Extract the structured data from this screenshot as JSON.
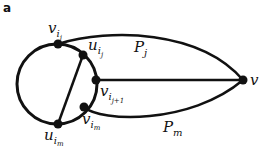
{
  "panel_label": "a",
  "nodes": {
    "v_ij": {
      "base": "v",
      "sub": "i",
      "subsub": "j"
    },
    "u_ij": {
      "base": "u",
      "sub": "i",
      "subsub": "j"
    },
    "v_ij1": {
      "base": "v",
      "sub": "i",
      "subsub": "j+1"
    },
    "v_im": {
      "base": "v",
      "sub": "i",
      "subsub": "m"
    },
    "u_im": {
      "base": "u",
      "sub": "i",
      "subsub": "m"
    },
    "v": {
      "base": "v"
    }
  },
  "paths": {
    "P_j": {
      "base": "P",
      "sub": "j"
    },
    "P_m": {
      "base": "P",
      "sub": "m"
    }
  },
  "colors": {
    "stroke": "#111111",
    "node": "#111111"
  }
}
